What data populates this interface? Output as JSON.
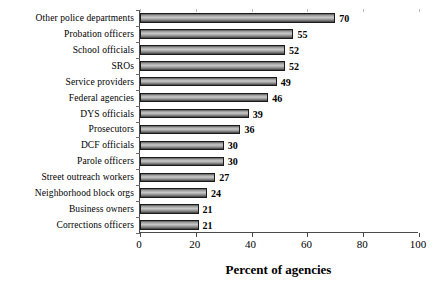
{
  "chart_data": {
    "type": "bar",
    "orientation": "horizontal",
    "title": "",
    "xlabel": "Percent of agencies",
    "ylabel": "",
    "xlim": [
      0,
      100
    ],
    "xticks": [
      0,
      20,
      40,
      60,
      80,
      100
    ],
    "grid": false,
    "legend": null,
    "categories": [
      "Other police departments",
      "Probation officers",
      "School officials",
      "SROs",
      "Service providers",
      "Federal agencies",
      "DYS officials",
      "Prosecutors",
      "DCF officials",
      "Parole officers",
      "Street outreach workers",
      "Neighborhood block orgs",
      "Business owners",
      "Corrections officers"
    ],
    "values": [
      70,
      55,
      52,
      52,
      49,
      46,
      39,
      36,
      30,
      30,
      27,
      24,
      21,
      21
    ],
    "value_labels": [
      "70",
      "55",
      "52",
      "52",
      "49",
      "46",
      "39",
      "36",
      "30",
      "30",
      "27",
      "24",
      "21",
      "21"
    ],
    "bar_color": "#9c9c9c",
    "bar_edge_color": "#1a1a1a",
    "axis_color": "#4a4a4a"
  },
  "axis": {
    "x_tick_labels": [
      "0",
      "20",
      "40",
      "60",
      "80",
      "100"
    ],
    "x_title": "Percent of agencies"
  }
}
